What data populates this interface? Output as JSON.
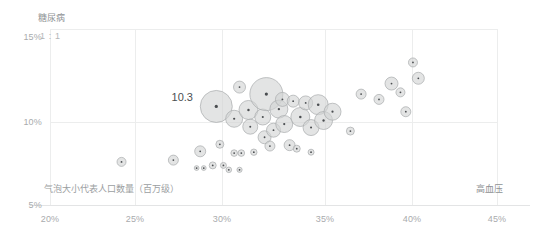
{
  "chart_data": {
    "type": "scatter",
    "title": "",
    "subtitle": "",
    "xlabel": "高血压",
    "ylabel": "糖尿病",
    "xlim": [
      20,
      45
    ],
    "ylim": [
      5,
      15
    ],
    "grid": true,
    "legend": false,
    "x_ticks": [
      "20%",
      "25%",
      "30%",
      "35%",
      "40%",
      "45%"
    ],
    "x_tick_values": [
      20,
      25,
      30,
      35,
      40,
      45
    ],
    "y_ticks": [
      "15%",
      "10%",
      "5%"
    ],
    "y_tick_values": [
      15,
      10,
      5
    ],
    "size_note": "气泡大小代表人口数量（百万级）",
    "size_encoding": "bubble area = population (millions)",
    "reference_line_label": "1 : 1",
    "annotations": [
      {
        "text": "10.3",
        "x": 29.2,
        "y": 10.55
      }
    ],
    "series": [
      {
        "name": "国家/地区",
        "points": [
          {
            "x": 24.0,
            "y": 7.45,
            "r": 4.5
          },
          {
            "x": 26.9,
            "y": 7.55,
            "r": 5.0
          },
          {
            "x": 28.4,
            "y": 8.05,
            "r": 5.5
          },
          {
            "x": 29.5,
            "y": 8.45,
            "r": 4.0
          },
          {
            "x": 29.1,
            "y": 7.25,
            "r": 3.5
          },
          {
            "x": 29.7,
            "y": 7.25,
            "r": 3.0
          },
          {
            "x": 30.3,
            "y": 7.95,
            "r": 3.3
          },
          {
            "x": 30.7,
            "y": 7.95,
            "r": 3.3
          },
          {
            "x": 29.3,
            "y": 10.6,
            "r": 16.0
          },
          {
            "x": 30.6,
            "y": 11.7,
            "r": 6.0
          },
          {
            "x": 30.3,
            "y": 9.9,
            "r": 8.5
          },
          {
            "x": 31.2,
            "y": 9.45,
            "r": 7.5
          },
          {
            "x": 31.1,
            "y": 10.4,
            "r": 9.5
          },
          {
            "x": 31.9,
            "y": 10.0,
            "r": 8.0
          },
          {
            "x": 32.1,
            "y": 11.3,
            "r": 16.5
          },
          {
            "x": 32.0,
            "y": 8.85,
            "r": 6.5
          },
          {
            "x": 32.5,
            "y": 9.25,
            "r": 7.0
          },
          {
            "x": 32.8,
            "y": 10.45,
            "r": 9.0
          },
          {
            "x": 33.0,
            "y": 11.0,
            "r": 7.0
          },
          {
            "x": 33.1,
            "y": 9.6,
            "r": 8.5
          },
          {
            "x": 32.3,
            "y": 8.35,
            "r": 5.0
          },
          {
            "x": 33.4,
            "y": 8.4,
            "r": 5.5
          },
          {
            "x": 33.6,
            "y": 10.9,
            "r": 6.0
          },
          {
            "x": 34.0,
            "y": 10.0,
            "r": 9.5
          },
          {
            "x": 34.3,
            "y": 10.8,
            "r": 7.0
          },
          {
            "x": 34.6,
            "y": 9.4,
            "r": 8.0
          },
          {
            "x": 35.0,
            "y": 10.7,
            "r": 10.0
          },
          {
            "x": 35.3,
            "y": 9.8,
            "r": 9.0
          },
          {
            "x": 35.8,
            "y": 10.3,
            "r": 8.5
          },
          {
            "x": 31.4,
            "y": 8.0,
            "r": 3.2
          },
          {
            "x": 33.8,
            "y": 8.2,
            "r": 3.5
          },
          {
            "x": 34.6,
            "y": 8.0,
            "r": 3.0
          },
          {
            "x": 30.0,
            "y": 7.0,
            "r": 2.8
          },
          {
            "x": 30.6,
            "y": 7.0,
            "r": 2.6
          },
          {
            "x": 37.4,
            "y": 11.3,
            "r": 5.0
          },
          {
            "x": 38.4,
            "y": 11.0,
            "r": 5.0
          },
          {
            "x": 39.1,
            "y": 11.9,
            "r": 6.5
          },
          {
            "x": 39.6,
            "y": 11.4,
            "r": 4.5
          },
          {
            "x": 39.9,
            "y": 10.3,
            "r": 5.0
          },
          {
            "x": 40.6,
            "y": 12.2,
            "r": 6.0
          },
          {
            "x": 40.3,
            "y": 13.1,
            "r": 4.5
          },
          {
            "x": 36.8,
            "y": 9.2,
            "r": 4.0
          },
          {
            "x": 28.2,
            "y": 7.1,
            "r": 2.4
          },
          {
            "x": 28.6,
            "y": 7.1,
            "r": 2.4
          }
        ]
      }
    ]
  }
}
